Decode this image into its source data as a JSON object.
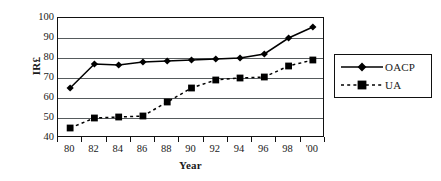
{
  "chart_data": {
    "type": "line",
    "title": "",
    "subtitle": "",
    "xlabel": "Year",
    "ylabel": "IR£",
    "categories": [
      "80",
      "82",
      "84",
      "86",
      "88",
      "90",
      "92",
      "94",
      "96",
      "98",
      "'00"
    ],
    "ylim": [
      40,
      100
    ],
    "yticks": [
      40,
      50,
      60,
      70,
      80,
      90,
      100
    ],
    "ytick_labels": [
      "40",
      "50",
      "60",
      "70",
      "80",
      "90",
      "100"
    ],
    "grid": "horizontal",
    "legend_position": "right-outside",
    "series": [
      {
        "name": "OACP",
        "marker": "diamond",
        "line_style": "solid",
        "color": "#000000",
        "values": [
          65,
          77,
          76.5,
          78,
          78.5,
          79,
          79.5,
          80,
          82,
          90,
          95.5
        ]
      },
      {
        "name": "UA",
        "marker": "square",
        "line_style": "dashed",
        "color": "#000000",
        "values": [
          45,
          50,
          50.5,
          51,
          58,
          65,
          69,
          70,
          70.5,
          76,
          79
        ]
      }
    ]
  },
  "legend": {
    "entries": [
      {
        "label": "OACP"
      },
      {
        "label": "UA"
      }
    ]
  }
}
